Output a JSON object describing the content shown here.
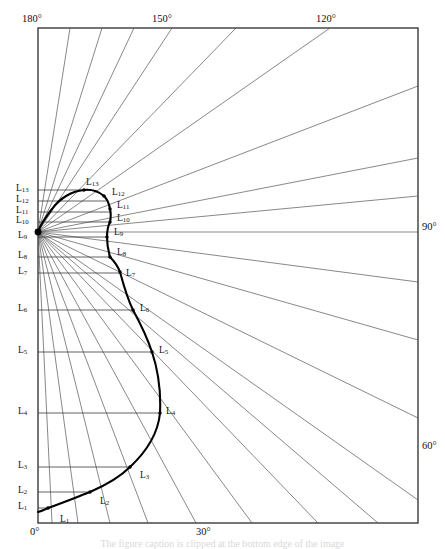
{
  "figure": {
    "type": "polar-radial-diagram",
    "caption_partial": "The figure caption is clipped at the bottom edge of the image",
    "frame": {
      "left": 38,
      "top": 28,
      "right": 418,
      "bottom": 523
    },
    "origin": {
      "x": 38,
      "y": 232,
      "label": "radial origin on left axis near L9/L10"
    }
  },
  "angle_labels": [
    {
      "text": "180°",
      "x": 22,
      "y": 14,
      "edge": "top-left"
    },
    {
      "text": "150°",
      "x": 152,
      "y": 14,
      "edge": "top"
    },
    {
      "text": "120°",
      "x": 316,
      "y": 14,
      "edge": "top"
    },
    {
      "text": "90°",
      "x": 422,
      "y": 222,
      "edge": "right"
    },
    {
      "text": "60°",
      "x": 422,
      "y": 441,
      "edge": "right"
    },
    {
      "text": "0°",
      "x": 30,
      "y": 527,
      "edge": "bottom-left"
    },
    {
      "text": "30°",
      "x": 196,
      "y": 527,
      "edge": "bottom"
    }
  ],
  "axis_labels": [
    {
      "name": "L",
      "sub": "13",
      "y": 190
    },
    {
      "name": "L",
      "sub": "12",
      "y": 201
    },
    {
      "name": "L",
      "sub": "11",
      "y": 212
    },
    {
      "name": "L",
      "sub": "10",
      "y": 222
    },
    {
      "name": "L",
      "sub": "9",
      "y": 237
    },
    {
      "name": "L",
      "sub": "8",
      "y": 257
    },
    {
      "name": "L",
      "sub": "7",
      "y": 273
    },
    {
      "name": "L",
      "sub": "6",
      "y": 310
    },
    {
      "name": "L",
      "sub": "5",
      "y": 352
    },
    {
      "name": "L",
      "sub": "4",
      "y": 413
    },
    {
      "name": "L",
      "sub": "3",
      "y": 467
    },
    {
      "name": "L",
      "sub": "2",
      "y": 492
    },
    {
      "name": "L",
      "sub": "1",
      "y": 508
    }
  ],
  "curve_points": [
    {
      "name": "L",
      "sub": "1",
      "x": 48,
      "y": 508,
      "lx": 60,
      "ly": 515
    },
    {
      "name": "L",
      "sub": "2",
      "x": 90,
      "y": 492,
      "lx": 100,
      "ly": 497
    },
    {
      "name": "L",
      "sub": "3",
      "x": 130,
      "y": 467,
      "lx": 140,
      "ly": 471
    },
    {
      "name": "L",
      "sub": "4",
      "x": 160,
      "y": 413,
      "lx": 166,
      "ly": 415
    },
    {
      "name": "L",
      "sub": "5",
      "x": 152,
      "y": 352,
      "lx": 159,
      "ly": 354
    },
    {
      "name": "L",
      "sub": "6",
      "x": 133,
      "y": 310,
      "lx": 140,
      "ly": 312
    },
    {
      "name": "L",
      "sub": "7",
      "x": 120,
      "y": 272,
      "lx": 126,
      "ly": 275
    },
    {
      "name": "L",
      "sub": "8",
      "x": 110,
      "y": 257,
      "lx": 117,
      "ly": 254
    },
    {
      "name": "L",
      "sub": "9",
      "x": 107,
      "y": 237,
      "lx": 114,
      "ly": 234
    },
    {
      "name": "L",
      "sub": "10",
      "x": 110,
      "y": 222,
      "lx": 117,
      "ly": 219
    },
    {
      "name": "L",
      "sub": "11",
      "x": 110,
      "y": 209,
      "lx": 117,
      "ly": 206
    },
    {
      "name": "L",
      "sub": "12",
      "x": 104,
      "y": 196,
      "lx": 112,
      "ly": 192
    },
    {
      "name": "L",
      "sub": "13",
      "x": 84,
      "y": 190,
      "lx": 88,
      "ly": 184
    }
  ],
  "colors": {
    "frame": "#2b2b2b",
    "radial_line": "#555555",
    "tick_line": "#3a3a3a",
    "curve": "#000000",
    "label": "#111111",
    "caption": "#d9d9d9"
  },
  "geometry": {
    "radial_top_x": [
      70,
      102,
      134,
      166,
      230,
      320,
      418
    ],
    "radial_right_y": [
      158,
      196,
      232,
      282,
      340,
      418,
      470
    ],
    "radial_bottom_x": [
      78,
      110,
      148,
      196,
      252,
      318,
      378
    ]
  }
}
